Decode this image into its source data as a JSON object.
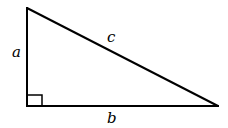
{
  "diagram": {
    "type": "right-triangle",
    "stroke_color": "#000000",
    "background": "#ffffff",
    "vertices": {
      "top": [
        27,
        8
      ],
      "right_angle": [
        27,
        106
      ],
      "right": [
        218,
        106
      ]
    },
    "right_angle_marker_size": 15,
    "labels": {
      "side_a": "a",
      "side_b": "b",
      "side_c": "c"
    }
  }
}
